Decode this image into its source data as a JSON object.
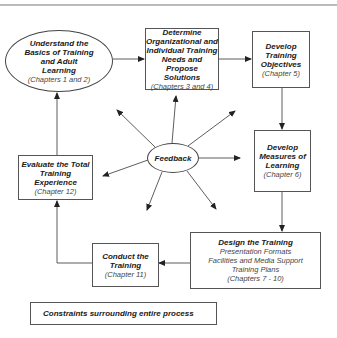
{
  "diagram": {
    "type": "process-cycle",
    "nodes": [
      {
        "id": "understand",
        "shape": "ellipse",
        "title_lines": [
          "Understand the",
          "Basics of Training",
          "and Adult",
          "Learning"
        ],
        "subtitle": "(Chapters 1 and 2)"
      },
      {
        "id": "determine",
        "shape": "box",
        "title_lines": [
          "Determine",
          "Organizational and",
          "Individual Training",
          "Needs and Propose",
          "Solutions"
        ],
        "subtitle": "(Chapters 3 and 4)"
      },
      {
        "id": "objectives",
        "shape": "box",
        "title_lines": [
          "Develop",
          "Training",
          "Objectives"
        ],
        "subtitle": "(Chapter 5)"
      },
      {
        "id": "measures",
        "shape": "box",
        "title_lines": [
          "Develop",
          "Measures of",
          "Learning"
        ],
        "subtitle": "(Chapter 6)"
      },
      {
        "id": "design",
        "shape": "box",
        "title_lines": [
          "Design the Training"
        ],
        "detail_lines": [
          "Presentation Formats",
          "Facilities and Media Support",
          "Training Plans"
        ],
        "subtitle": "(Chapters 7 - 10)"
      },
      {
        "id": "conduct",
        "shape": "box",
        "title_lines": [
          "Conduct the",
          "Training"
        ],
        "subtitle": "(Chapter 11)"
      },
      {
        "id": "evaluate",
        "shape": "box",
        "title_lines": [
          "Evaluate the Total",
          "Training",
          "Experience"
        ],
        "subtitle": "(Chapter 12)"
      },
      {
        "id": "feedback",
        "shape": "ellipse",
        "title_lines": [
          "Feedback"
        ]
      }
    ],
    "edges": [
      {
        "from": "understand",
        "to": "determine"
      },
      {
        "from": "determine",
        "to": "objectives"
      },
      {
        "from": "objectives",
        "to": "measures"
      },
      {
        "from": "measures",
        "to": "design"
      },
      {
        "from": "design",
        "to": "conduct"
      },
      {
        "from": "conduct",
        "to": "evaluate"
      },
      {
        "from": "evaluate",
        "to": "understand"
      },
      {
        "from": "feedback",
        "to": "understand"
      },
      {
        "from": "feedback",
        "to": "determine"
      },
      {
        "from": "feedback",
        "to": "objectives"
      },
      {
        "from": "feedback",
        "to": "measures"
      },
      {
        "from": "feedback",
        "to": "design"
      },
      {
        "from": "feedback",
        "to": "conduct"
      },
      {
        "from": "feedback",
        "to": "evaluate"
      }
    ],
    "footer_note": "Constraints surrounding entire process"
  }
}
